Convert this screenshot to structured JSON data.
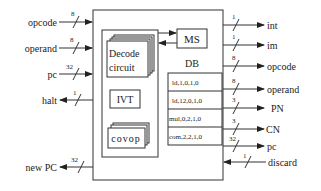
{
  "diagram": {
    "inputs_left": [
      {
        "label": "opcode",
        "width": "8",
        "direction": "in",
        "y": 22
      },
      {
        "label": "operand",
        "width": "8",
        "direction": "in",
        "y": 48
      },
      {
        "label": "pc",
        "width": "32",
        "direction": "in",
        "y": 74
      },
      {
        "label": "halt",
        "width": "1",
        "direction": "out",
        "y": 100
      },
      {
        "label": "new PC",
        "width": "32",
        "direction": "out",
        "y": 167
      }
    ],
    "outputs_right": [
      {
        "label": "int",
        "width": "1",
        "direction": "out",
        "y": 25
      },
      {
        "label": "im",
        "width": "1",
        "direction": "out",
        "y": 45
      },
      {
        "label": "opcode",
        "width": "8",
        "direction": "out",
        "y": 66
      },
      {
        "label": "operand",
        "width": "8",
        "direction": "out",
        "y": 89
      },
      {
        "label": "PN",
        "width": "3",
        "direction": "out",
        "y": 108
      },
      {
        "label": "CN",
        "width": "3",
        "direction": "out",
        "y": 129
      },
      {
        "label": "pc",
        "width": "32",
        "direction": "out",
        "y": 146
      },
      {
        "label": "discard",
        "width": "1",
        "direction": "in",
        "y": 162
      }
    ],
    "decode": {
      "line1": "Decode",
      "line2": "circuit"
    },
    "ms": "MS",
    "ivt": "IVT",
    "covop": "covop",
    "db": {
      "title": "DB",
      "rows": [
        "ld,1,0,1,0",
        "ld,12,0,1,0",
        "mul,0,2,1,0",
        "com,2,2,1,0"
      ]
    }
  }
}
